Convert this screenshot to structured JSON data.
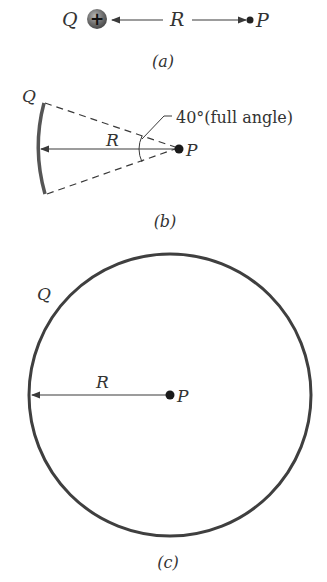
{
  "panel_a": {
    "charge_label": "Q",
    "charge_sign": "+",
    "distance_label": "R",
    "point_label": "P",
    "caption": "(a)"
  },
  "panel_b": {
    "charge_label": "Q",
    "distance_label": "R",
    "point_label": "P",
    "angle_annotation": "40°(full angle)",
    "caption": "(b)"
  },
  "panel_c": {
    "charge_label": "Q",
    "distance_label": "R",
    "point_label": "P",
    "caption": "(c)"
  },
  "colors": {
    "stroke": "#3a3a3a",
    "charge_fill": "#6a6a6a",
    "text": "#333333"
  }
}
